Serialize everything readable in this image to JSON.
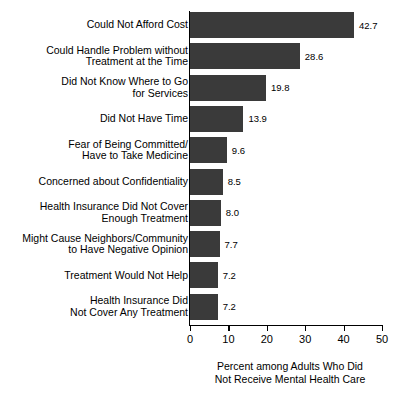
{
  "chart_data": {
    "type": "bar",
    "orientation": "horizontal",
    "title": "",
    "xlabel": "Percent among Adults Who Did\nNot Receive Mental Health Care",
    "ylabel": "",
    "xlim": [
      0,
      50
    ],
    "xticks": [
      0,
      10,
      20,
      30,
      40,
      50
    ],
    "xtick_labels": [
      "0",
      "10",
      "20",
      "30",
      "40",
      "50"
    ],
    "grid": false,
    "legend": false,
    "bar_color": "#3a3a3a",
    "categories": [
      "Could Not Afford Cost",
      "Could Handle Problem without\nTreatment at the Time",
      "Did Not Know Where to Go\nfor Services",
      "Did Not Have Time",
      "Fear of Being Committed/\nHave to Take Medicine",
      "Concerned about Confidentiality",
      "Health Insurance Did Not Cover\nEnough Treatment",
      "Might Cause Neighbors/Community\nto Have Negative Opinion",
      "Treatment Would Not Help",
      "Health Insurance Did\nNot Cover Any Treatment"
    ],
    "values": [
      42.7,
      28.6,
      19.8,
      13.9,
      9.6,
      8.5,
      8.0,
      7.7,
      7.2,
      7.2
    ],
    "value_labels": [
      "42.7",
      "28.6",
      "19.8",
      "13.9",
      "9.6",
      "8.5",
      "8.0",
      "7.7",
      "7.2",
      "7.2"
    ]
  }
}
